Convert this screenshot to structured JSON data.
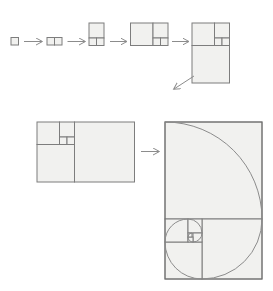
{
  "diagram": {
    "name": "fibonacci-golden-rectangle-construction",
    "canvas": {
      "width": 273,
      "height": 291
    },
    "fibonacci_sequence": [
      1,
      1,
      2,
      3,
      5,
      8,
      13
    ],
    "colors": {
      "background": "#ffffff",
      "square_fill": "#f1f1ef",
      "square_stroke": "#7d7d7d",
      "outer_stroke": "#6e6e6e",
      "arrow": "#8c8c8c",
      "spiral": "#8c8c8c"
    },
    "stages": [
      {
        "name": "stage-1-unit-square",
        "squares": [
          {
            "x": 11,
            "y": 37.5,
            "s": 7.5,
            "fib": 1
          }
        ]
      },
      {
        "name": "stage-2-two-squares",
        "squares": [
          {
            "x": 47,
            "y": 37.5,
            "s": 7.5,
            "fib": 1
          },
          {
            "x": 54.5,
            "y": 37.5,
            "s": 7.5,
            "fib": 1
          }
        ]
      },
      {
        "name": "stage-3-2x3",
        "squares": [
          {
            "x": 89,
            "y": 23,
            "s": 15,
            "fib": 2
          },
          {
            "x": 89,
            "y": 38,
            "s": 7.5,
            "fib": 1
          },
          {
            "x": 96.5,
            "y": 38,
            "s": 7.5,
            "fib": 1
          }
        ]
      },
      {
        "name": "stage-4-5x3",
        "squares": [
          {
            "x": 130.5,
            "y": 23,
            "s": 22.5,
            "fib": 3
          },
          {
            "x": 153,
            "y": 23,
            "s": 15,
            "fib": 2
          },
          {
            "x": 153,
            "y": 38,
            "s": 7.5,
            "fib": 1
          },
          {
            "x": 160.5,
            "y": 38,
            "s": 7.5,
            "fib": 1
          }
        ]
      },
      {
        "name": "stage-5-5x8",
        "squares": [
          {
            "x": 192,
            "y": 23,
            "s": 22.5,
            "fib": 3
          },
          {
            "x": 214.5,
            "y": 23,
            "s": 15,
            "fib": 2
          },
          {
            "x": 214.5,
            "y": 38,
            "s": 7.5,
            "fib": 1
          },
          {
            "x": 222,
            "y": 38,
            "s": 7.5,
            "fib": 1
          },
          {
            "x": 192,
            "y": 45.5,
            "s": 37.5,
            "fib": 5
          }
        ]
      },
      {
        "name": "stage-6-13x8",
        "squares": [
          {
            "x": 74.5,
            "y": 122,
            "s": 60,
            "fib": 8
          },
          {
            "x": 37,
            "y": 144.5,
            "s": 37.5,
            "fib": 5
          },
          {
            "x": 37,
            "y": 122,
            "s": 22.5,
            "fib": 3
          },
          {
            "x": 59.5,
            "y": 122,
            "s": 15,
            "fib": 2
          },
          {
            "x": 59.5,
            "y": 137,
            "s": 7.5,
            "fib": 1
          },
          {
            "x": 67,
            "y": 137,
            "s": 7.5,
            "fib": 1
          }
        ]
      },
      {
        "name": "stage-7-golden-rectangle-spiral",
        "outer": {
          "x": 165,
          "y": 122,
          "w": 97,
          "h": 157
        },
        "squares": [
          {
            "x": 165,
            "y": 122,
            "s": 97,
            "fib": 13
          },
          {
            "x": 202,
            "y": 219,
            "s": 60,
            "fib": 8
          },
          {
            "x": 165,
            "y": 242,
            "s": 37,
            "fib": 5
          },
          {
            "x": 165,
            "y": 219,
            "s": 23,
            "fib": 3
          },
          {
            "x": 188,
            "y": 219,
            "s": 14,
            "fib": 2
          },
          {
            "x": 193,
            "y": 233,
            "s": 9,
            "fib": 1
          },
          {
            "x": 188,
            "y": 237,
            "s": 5,
            "fib": 1
          },
          {
            "x": 188,
            "y": 233,
            "s": 4,
            "fib": 1
          }
        ]
      }
    ],
    "arrows": [
      {
        "name": "arrow-1",
        "x1": 24,
        "y1": 41.5,
        "x2": 42,
        "y2": 41.5
      },
      {
        "name": "arrow-2",
        "x1": 67.5,
        "y1": 41.5,
        "x2": 85,
        "y2": 41.5
      },
      {
        "name": "arrow-3",
        "x1": 110,
        "y1": 41.5,
        "x2": 126.5,
        "y2": 41.5
      },
      {
        "name": "arrow-4",
        "x1": 172,
        "y1": 41.5,
        "x2": 188.5,
        "y2": 41.5
      },
      {
        "name": "arrow-5-diagonal",
        "x1": 194,
        "y1": 76,
        "x2": 174,
        "y2": 89
      },
      {
        "name": "arrow-6",
        "x1": 141,
        "y1": 151.5,
        "x2": 159,
        "y2": 151.5
      }
    ],
    "spiral": {
      "start": {
        "x": 165,
        "y": 122
      },
      "arcs": [
        {
          "r": 97,
          "x": 262,
          "y": 219
        },
        {
          "r": 60,
          "x": 202,
          "y": 279
        },
        {
          "r": 37,
          "x": 165,
          "y": 242
        },
        {
          "r": 23,
          "x": 188,
          "y": 219
        },
        {
          "r": 14,
          "x": 202,
          "y": 233
        },
        {
          "r": 9,
          "x": 193,
          "y": 242
        },
        {
          "r": 5,
          "x": 188,
          "y": 237
        },
        {
          "r": 4,
          "x": 192,
          "y": 233
        }
      ]
    }
  }
}
